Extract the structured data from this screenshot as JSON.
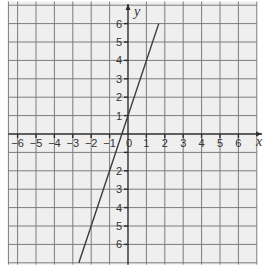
{
  "chart_data": {
    "type": "line",
    "title": "",
    "xlabel": "x",
    "ylabel": "y",
    "xlim": [
      -6.5,
      7
    ],
    "ylim": [
      -7,
      7
    ],
    "x_ticks": [
      -6,
      -5,
      -4,
      -3,
      -2,
      -1,
      1,
      2,
      3,
      4,
      5,
      6
    ],
    "y_ticks": [
      6,
      5,
      4,
      3,
      2,
      1,
      -1,
      -2,
      -3,
      -4,
      -5,
      -6
    ],
    "x_tick_labels": [
      "−6",
      "−5",
      "−4",
      "−3",
      "−2",
      "−1",
      "1",
      "2",
      "3",
      "4",
      "5",
      "6"
    ],
    "y_tick_labels": [
      "6",
      "5",
      "4",
      "3",
      "2",
      "1",
      "2",
      "3",
      "4",
      "5",
      "6"
    ],
    "origin_label": "0",
    "grid": true,
    "legend": null,
    "series": [
      {
        "name": "y = 3x + 1",
        "equation": "y = 3x + 1",
        "x": [
          -2.67,
          1.67
        ],
        "y": [
          -7,
          6
        ]
      }
    ]
  },
  "colors": {
    "grid_background": "#efeff0",
    "grid_lines": "#7c7c7c",
    "axes": "#2e2e2e",
    "line": "#3a3a3a"
  }
}
